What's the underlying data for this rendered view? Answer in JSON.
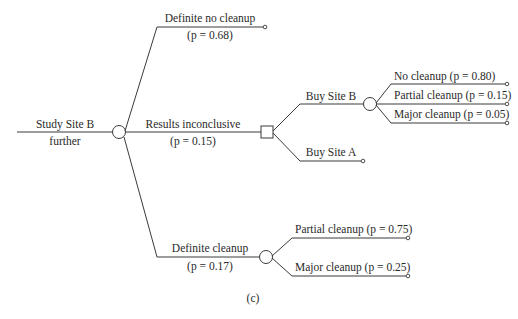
{
  "diagram": {
    "type": "decision-tree",
    "caption": "(c)",
    "root": {
      "label_line1": "Study Site B",
      "label_line2": "further",
      "node_type": "chance"
    },
    "branches": {
      "no_cleanup": {
        "label": "Definite no cleanup",
        "prob": "(p = 0.68)"
      },
      "inconclusive": {
        "label": "Results inconclusive",
        "prob": "(p = 0.15)",
        "node_type": "decision",
        "options": {
          "buy_b": {
            "label": "Buy Site B",
            "node_type": "chance",
            "outcomes": [
              {
                "label": "No cleanup (p = 0.80)"
              },
              {
                "label": "Partial cleanup (p = 0.15)"
              },
              {
                "label": "Major cleanup (p = 0.05)"
              }
            ]
          },
          "buy_a": {
            "label": "Buy Site A"
          }
        }
      },
      "definite_cleanup": {
        "label": "Definite cleanup",
        "prob": "(p = 0.17)",
        "node_type": "chance",
        "outcomes": [
          {
            "label": "Partial cleanup (p = 0.75)"
          },
          {
            "label": "Major cleanup (p = 0.25)"
          }
        ]
      }
    }
  }
}
